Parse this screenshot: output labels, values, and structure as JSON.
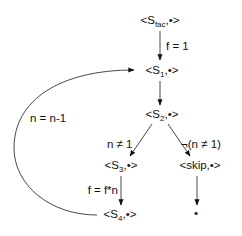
{
  "diagram": {
    "type": "transition-system",
    "nodes": [
      {
        "id": "sfac",
        "prefix": "<S",
        "sub": "fac",
        "suffix": ",•>",
        "x": 160,
        "y": 24
      },
      {
        "id": "s1",
        "prefix": "<S",
        "sub": "1",
        "suffix": ",•>",
        "x": 160,
        "y": 74
      },
      {
        "id": "s2",
        "prefix": "<S",
        "sub": "2",
        "suffix": ",•>",
        "x": 160,
        "y": 118
      },
      {
        "id": "s3",
        "prefix": "<S",
        "sub": "3",
        "suffix": ",•>",
        "x": 121,
        "y": 169
      },
      {
        "id": "skip",
        "prefix": "<skip,•>",
        "sub": "",
        "suffix": "",
        "x": 199,
        "y": 169
      },
      {
        "id": "s4",
        "prefix": "<S",
        "sub": "4",
        "suffix": ",•>",
        "x": 121,
        "y": 218
      },
      {
        "id": "terminal",
        "prefix": "•",
        "sub": "",
        "suffix": "",
        "x": 196,
        "y": 218
      }
    ],
    "edges": [
      {
        "from": "sfac",
        "to": "s1",
        "label": "f = 1"
      },
      {
        "from": "s1",
        "to": "s2",
        "label": ""
      },
      {
        "from": "s2",
        "to": "s3",
        "label": "n ≠ 1"
      },
      {
        "from": "s2",
        "to": "skip",
        "label": "¬(n ≠ 1)"
      },
      {
        "from": "s3",
        "to": "s4",
        "label": "f = f*n"
      },
      {
        "from": "skip",
        "to": "terminal",
        "label": ""
      },
      {
        "from": "s4",
        "to": "s1",
        "label": "n = n-1"
      }
    ]
  }
}
